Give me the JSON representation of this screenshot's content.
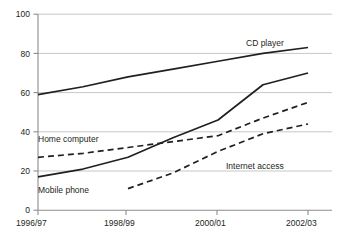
{
  "chart_data": {
    "type": "line",
    "title": "",
    "subtitle": "",
    "xlabel": "",
    "ylabel": "",
    "x": [
      "1996/97",
      "1997/98",
      "1998/99",
      "1999/00",
      "2000/01",
      "2001/02",
      "2002/03"
    ],
    "categories": [
      "1996/97",
      "1997/98",
      "1998/99",
      "1999/00",
      "2000/01",
      "2001/02",
      "2002/03"
    ],
    "xtick_labels": [
      "1996/97",
      "1998/99",
      "2000/01",
      "2002/03"
    ],
    "ytick_labels": [
      "0",
      "20",
      "40",
      "60",
      "80",
      "100"
    ],
    "ylim": [
      0,
      100
    ],
    "ytick_values": [
      0,
      20,
      40,
      60,
      80,
      100
    ],
    "grid": "horizontal",
    "legend": "inline-labels",
    "series": [
      {
        "name": "CD player",
        "style": "solid",
        "color": "#231f20",
        "label_text": "CD player",
        "x": [
          "1996/97",
          "1997/98",
          "1998/99",
          "1999/00",
          "2000/01",
          "2001/02",
          "2002/03"
        ],
        "values": [
          59,
          63,
          68,
          72,
          76,
          80,
          83
        ]
      },
      {
        "name": "Mobile phone",
        "style": "solid",
        "color": "#231f20",
        "label_text": "Mobile phone",
        "x": [
          "1996/97",
          "1997/98",
          "1998/99",
          "1999/00",
          "2000/01",
          "2001/02",
          "2002/03"
        ],
        "values": [
          17,
          21,
          27,
          37,
          46,
          64,
          70
        ]
      },
      {
        "name": "Home computer",
        "style": "dashed",
        "color": "#231f20",
        "label_text": "Home computer",
        "x": [
          "1996/97",
          "1997/98",
          "1998/99",
          "1999/00",
          "2000/01",
          "2001/02",
          "2002/03"
        ],
        "values": [
          27,
          29,
          32,
          35,
          38,
          47,
          55
        ]
      },
      {
        "name": "Internet access",
        "style": "dashed",
        "color": "#231f20",
        "label_text": "Internet access",
        "x": [
          "1998/99",
          "1999/00",
          "2000/01",
          "2001/02",
          "2002/03"
        ],
        "values": [
          11,
          19,
          30,
          39,
          44
        ]
      }
    ],
    "annotations": [
      {
        "text": "CD player",
        "series": "CD player"
      },
      {
        "text": "Mobile phone",
        "series": "Mobile phone"
      },
      {
        "text": "Home computer",
        "series": "Home computer"
      },
      {
        "text": "Internet access",
        "series": "Internet access"
      }
    ]
  }
}
